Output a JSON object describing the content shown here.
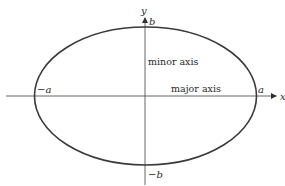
{
  "diagram": {
    "type": "ellipse",
    "colors": {
      "stroke": "#3a3a3a",
      "axis": "#555555",
      "text": "#2a2a2a",
      "background": "#ffffff"
    },
    "axes": {
      "x_label": "x",
      "y_label": "y"
    },
    "vertices": {
      "pos_a": "a",
      "neg_a": "−a",
      "pos_b": "b",
      "neg_b": "−b"
    },
    "annotations": {
      "minor_axis": "minor axis",
      "major_axis": "major axis"
    }
  }
}
